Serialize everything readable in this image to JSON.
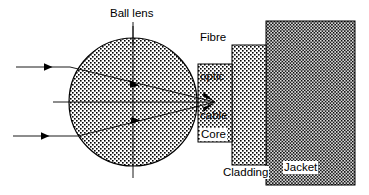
{
  "diagram": {
    "canvas": {
      "width": 369,
      "height": 195,
      "background": "#ffffff"
    },
    "labels": {
      "ball_lens": "Ball lens",
      "fibre_optic_cable_line1": "Fibre",
      "fibre_optic_cable_line2": "optic",
      "fibre_optic_cable_line3": "cable",
      "core": "Core",
      "cladding": "Cladding",
      "jacket": "Jacket"
    },
    "colors": {
      "stroke": "#000000",
      "fill_light": "#ffffff",
      "dot": "#000000",
      "jacket_tint": "#d9d9d9",
      "core_tint": "#ffffff",
      "cladding_tint": "#ffffff",
      "lens_tint": "#ffffff"
    },
    "shapes": {
      "ball_lens": {
        "type": "circle",
        "cx": 133,
        "cy": 102,
        "r": 64,
        "pattern": "dots-medium"
      },
      "core": {
        "type": "rect",
        "x": 198,
        "y": 64,
        "width": 34,
        "height": 78,
        "pattern": "dots-medium"
      },
      "cladding": {
        "type": "rect",
        "x": 232,
        "y": 45,
        "width": 34,
        "height": 120,
        "pattern": "dots-medium"
      },
      "jacket": {
        "type": "rect",
        "x": 266,
        "y": 21,
        "width": 89,
        "height": 164,
        "pattern": "dots-dense"
      }
    },
    "rays": {
      "incoming": [
        {
          "name": "upper-ray",
          "x1": 16,
          "y1": 67,
          "x2": 70,
          "y2": 67,
          "arrow_at": 0.58
        },
        {
          "name": "axis-ray",
          "x1": 53,
          "y1": 102,
          "x2": 215,
          "y2": 102,
          "arrow_at": null
        },
        {
          "name": "lower-ray",
          "x1": 13,
          "y1": 136,
          "x2": 78,
          "y2": 136,
          "arrow_at": 0.55
        }
      ],
      "refracted": [
        {
          "name": "upper-refracted",
          "x1": 70,
          "y1": 67,
          "x2": 215,
          "y2": 102,
          "arrow_at": 0.45
        },
        {
          "name": "lower-refracted",
          "x1": 78,
          "y1": 136,
          "x2": 215,
          "y2": 102,
          "arrow_at": 0.45
        }
      ],
      "focus_point": {
        "x": 215,
        "y": 102
      }
    },
    "axes": {
      "vertical": {
        "x": 133,
        "y1": 26,
        "y2": 178
      },
      "horizontal": {
        "y": 102,
        "x1": 53,
        "x2": 215
      }
    },
    "leaders": {
      "ball_lens_leader": {
        "x": 133,
        "y1": 22,
        "y2": 45
      }
    }
  }
}
